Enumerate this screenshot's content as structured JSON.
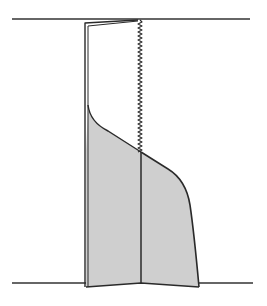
{
  "canvas": {
    "width": 267,
    "height": 306,
    "background": "#ffffff"
  },
  "colors": {
    "line": "#2a2a2a",
    "fill": "#cfcfcf",
    "baseline": "#333333"
  },
  "lines": {
    "top_baseline": {
      "x1": 12,
      "y1": 19,
      "x2": 250,
      "y2": 19
    },
    "bottom_baseline": {
      "x1": 12,
      "y1": 283,
      "x2": 253,
      "y2": 283
    }
  },
  "shape": {
    "filled_region": "M86,287 L86,150 L88,110 Q92,122 108,130 L141,152 L168,170 Q185,180 190,205 Q194,230 199,287 L141,283 Z",
    "left_edge_outer": "M85,287 L85,23 L138,20",
    "left_edge_inner": "M88,287 L88,26 L138,21",
    "upper_curve": "M88,105 Q90,122 108,131 L141,152",
    "right_curve": "M141,152 L168,169 Q186,180 190,205 Q194,232 199,287",
    "bottom_edge": "M86,287 L141,283 L199,287",
    "divider_line": {
      "x1": 141,
      "y1": 152,
      "x2": 141,
      "y2": 283
    },
    "zigzag": {
      "x": 140,
      "y_start": 20,
      "y_end": 152,
      "amplitude": 2,
      "period": 4
    }
  }
}
